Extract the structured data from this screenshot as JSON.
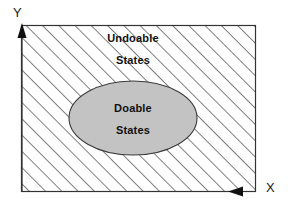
{
  "diagram": {
    "axes": {
      "y_label": "Y",
      "x_label": "X",
      "y_arrow": "arrow-up-icon",
      "x_arrow": "arrow-left-icon"
    },
    "regions": [
      {
        "id": "undoable",
        "label_line1": "Undoable",
        "label_line2": "States",
        "fill": "diagonal-hatch",
        "hatch_color": "#4d4d4d",
        "background": "#ffffff"
      },
      {
        "id": "doable",
        "label_line1": "Doable",
        "label_line2": "States",
        "fill": "solid-gray",
        "fill_color": "#c0c0c0",
        "border_color": "#333333"
      }
    ],
    "frame": {
      "border_color": "#333333",
      "x": 21,
      "y": 25,
      "width": 235,
      "height": 167
    },
    "ellipse": {
      "cx": 133,
      "cy": 118,
      "rx": 64,
      "ry": 37
    }
  }
}
